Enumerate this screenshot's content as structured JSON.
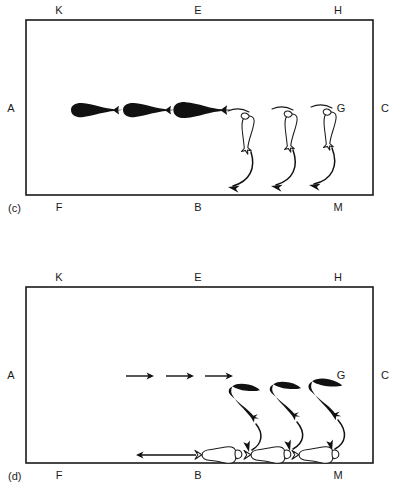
{
  "figure": {
    "title": "",
    "background_color": "#ffffff",
    "ink_color": "#1a1a1a",
    "width": 396,
    "height": 490
  },
  "panels": [
    {
      "tag": "(c)",
      "tag_position": {
        "x": 8,
        "y": 212
      },
      "tank": {
        "x": 26,
        "y": 20,
        "width": 347,
        "height": 175
      },
      "corner_labels": {
        "top_left": "K",
        "top_center": "E",
        "top_right": "H",
        "left": "A",
        "right": "C",
        "inner_right": "G",
        "bottom_left": "F",
        "bottom_center": "B",
        "bottom_right": "M"
      },
      "label_positions": {
        "top_left": {
          "x": 59,
          "y": 14
        },
        "top_center": {
          "x": 198,
          "y": 14
        },
        "top_right": {
          "x": 338,
          "y": 14
        },
        "left": {
          "x": 11,
          "y": 112
        },
        "right": {
          "x": 383,
          "y": 112
        },
        "inner_right": {
          "x": 340,
          "y": 112
        },
        "bottom_left": {
          "x": 59,
          "y": 211
        },
        "bottom_center": {
          "x": 198,
          "y": 211
        },
        "bottom_right": {
          "x": 338,
          "y": 211
        }
      },
      "black_fish": {
        "count": 3,
        "orientation": "horizontal-facing-left",
        "color": "#111111",
        "positions": [
          {
            "x": 93,
            "y": 110
          },
          {
            "x": 145,
            "y": 110
          },
          {
            "x": 198,
            "y": 110
          }
        ]
      },
      "white_fish": {
        "count": 3,
        "orientation": "vertical-head-up",
        "fill": "#ffffff",
        "outline": "#1a1a1a",
        "positions": [
          {
            "x": 247,
            "y": 133
          },
          {
            "x": 291,
            "y": 131
          },
          {
            "x": 330,
            "y": 129
          }
        ]
      },
      "trajectory_arrows": {
        "count": 3,
        "style": "curved-down-left",
        "description": "curved arrows sweeping down and to the left from each white fish"
      }
    },
    {
      "tag": "(d)",
      "tag_position": {
        "x": 8,
        "y": 480
      },
      "tank": {
        "x": 26,
        "y": 287,
        "width": 347,
        "height": 176
      },
      "corner_labels": {
        "top_left": "K",
        "top_center": "E",
        "top_right": "H",
        "left": "A",
        "right": "C",
        "inner_right": "G",
        "bottom_left": "F",
        "bottom_center": "B",
        "bottom_right": "M"
      },
      "label_positions": {
        "top_left": {
          "x": 59,
          "y": 281
        },
        "top_center": {
          "x": 198,
          "y": 281
        },
        "top_right": {
          "x": 338,
          "y": 281
        },
        "left": {
          "x": 11,
          "y": 379
        },
        "right": {
          "x": 383,
          "y": 379
        },
        "inner_right": {
          "x": 340,
          "y": 379
        },
        "bottom_left": {
          "x": 59,
          "y": 479
        },
        "bottom_center": {
          "x": 198,
          "y": 479
        },
        "bottom_right": {
          "x": 338,
          "y": 479
        }
      },
      "straight_arrows_top": {
        "count": 3,
        "direction": "right",
        "positions": [
          {
            "x": 130,
            "y": 376
          },
          {
            "x": 170,
            "y": 376
          },
          {
            "x": 209,
            "y": 376
          }
        ]
      },
      "straight_arrow_bottom": {
        "count": 1,
        "direction": "left",
        "position": {
          "x": 130,
          "y": 455
        }
      },
      "black_fish": {
        "count": 3,
        "orientation": "angled-head-up-left",
        "color": "#111111",
        "positions": [
          {
            "x": 243,
            "y": 400
          },
          {
            "x": 285,
            "y": 398
          },
          {
            "x": 325,
            "y": 396
          }
        ]
      },
      "white_fish": {
        "count": 3,
        "orientation": "horizontal-facing-left",
        "fill": "#ffffff",
        "outline": "#1a1a1a",
        "positions": [
          {
            "x": 218,
            "y": 455
          },
          {
            "x": 268,
            "y": 455
          },
          {
            "x": 316,
            "y": 455
          }
        ]
      },
      "trajectory_arrows": {
        "count": 3,
        "style": "curved-down-left",
        "description": "curved arrows sweeping down and to the left from each black fish toward the bottom"
      }
    }
  ]
}
